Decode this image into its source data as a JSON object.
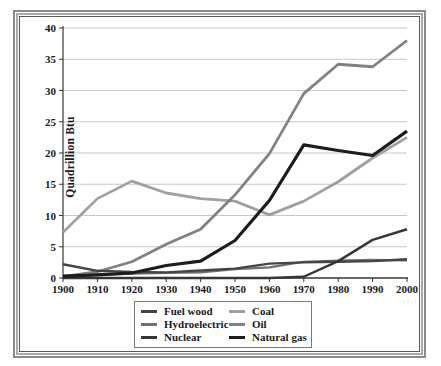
{
  "chart_data": {
    "type": "line",
    "title": "",
    "xlabel": "",
    "ylabel": "Quadrillion Btu",
    "ylim": [
      0,
      40
    ],
    "yticks": [
      0,
      5,
      10,
      15,
      20,
      25,
      30,
      35,
      40
    ],
    "grid": "horizontal",
    "legend_position": "bottom",
    "categories": [
      "1900",
      "1910",
      "1920",
      "1930",
      "1940",
      "1950",
      "1960",
      "1970",
      "1980",
      "1990",
      "2000"
    ],
    "series": [
      {
        "name": "Fuel wood",
        "color": "#454545",
        "width": 2.4,
        "values": [
          2.2,
          1.15,
          0.95,
          0.9,
          1.2,
          1.5,
          2.3,
          2.5,
          2.6,
          2.7,
          3.0
        ]
      },
      {
        "name": "Hydroelectric",
        "color": "#6f6f6f",
        "width": 2.2,
        "values": [
          0.25,
          0.5,
          0.7,
          0.8,
          0.9,
          1.4,
          1.7,
          2.6,
          2.8,
          2.9,
          2.8
        ]
      },
      {
        "name": "Nuclear",
        "color": "#363636",
        "width": 2.4,
        "values": [
          0,
          0,
          0,
          0,
          0,
          0,
          0.01,
          0.2,
          2.7,
          6.1,
          7.8
        ]
      },
      {
        "name": "Coal",
        "color": "#a0a0a0",
        "width": 2.8,
        "values": [
          7.3,
          12.7,
          15.5,
          13.6,
          12.7,
          12.3,
          10.1,
          12.3,
          15.4,
          19.2,
          22.5
        ]
      },
      {
        "name": "Oil",
        "color": "#828282",
        "width": 2.8,
        "values": [
          0.2,
          1.0,
          2.6,
          5.4,
          7.8,
          13.3,
          19.9,
          29.5,
          34.2,
          33.8,
          38.0
        ]
      },
      {
        "name": "Natural gas",
        "color": "#1d1d1d",
        "width": 3.2,
        "values": [
          0.3,
          0.5,
          0.8,
          2.0,
          2.7,
          6.0,
          12.4,
          21.3,
          20.4,
          19.6,
          23.5
        ]
      }
    ],
    "colors": {
      "gridline": "#c8c8c8",
      "axis": "#383838",
      "text": "#1a1a1a"
    }
  }
}
